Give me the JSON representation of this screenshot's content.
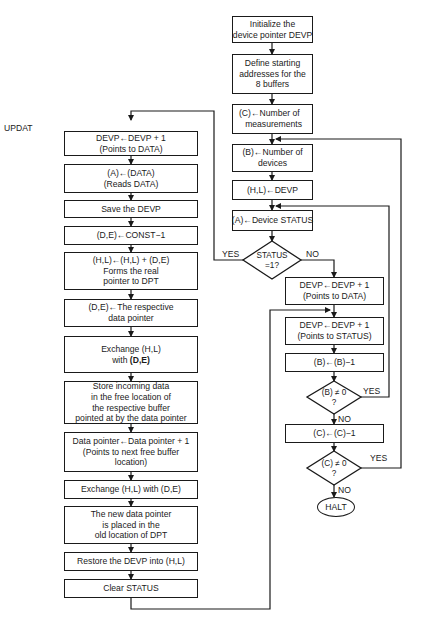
{
  "diagram": {
    "type": "flowchart",
    "entry_label": "UPDAT",
    "main_flow": {
      "init": [
        "Initialize the",
        "device pointer DEVP"
      ],
      "define": [
        "Define starting",
        "addresses for the",
        "8 buffers"
      ],
      "c_num": [
        "(C)←Number of",
        "measurements"
      ],
      "b_num": [
        "(B)←Number of",
        "devices"
      ],
      "hl_devp": "(H,L)←DEVP",
      "a_status": "(A)←Device STATUS",
      "status_decision": [
        "STATUS",
        "=1?"
      ],
      "status_yes": "YES",
      "status_no": "NO",
      "devp_data": [
        "DEVP←DEVP + 1",
        "(Points to DATA)"
      ],
      "devp_status": [
        "DEVP←DEVP + 1",
        "(Points to STATUS)"
      ],
      "b_dec": "(B)←(B)−1",
      "b_decision": [
        "(B) ≠ 0",
        "?"
      ],
      "b_yes": "YES",
      "b_no": "NO",
      "c_dec": "(C)←(C)−1",
      "c_decision": [
        "(C) ≠ 0",
        "?"
      ],
      "c_yes": "YES",
      "c_no": "NO",
      "halt": "HALT"
    },
    "updat_flow": {
      "s1": [
        "DEVP←DEVP + 1",
        "(Points to DATA)"
      ],
      "s2": [
        "(A)←(DATA)",
        "(Reads DATA)"
      ],
      "s3": "Save the DEVP",
      "s4": "(D,E)←CONST−1",
      "s5": [
        "(H,L)←(H,L) + (D,E)",
        "Forms the real",
        "pointer to DPT"
      ],
      "s6": [
        "(D,E)←The respective",
        "data pointer"
      ],
      "s7": [
        "Exchange (H,L)",
        "with",
        "(D,E)"
      ],
      "s8": [
        "Store incoming data",
        "in the free location of",
        "the respective buffer",
        "pointed at by the data pointer"
      ],
      "s9": [
        "Data pointer←Data pointer + 1",
        "(Points to next free buffer",
        "location)"
      ],
      "s10": "Exchange (H,L) with (D,E)",
      "s11": [
        "The new data pointer",
        "is placed in the",
        "old location of DPT"
      ],
      "s12": "Restore the DEVP into (H,L)",
      "s13": "Clear STATUS"
    },
    "colors": {
      "line": "#1a1a1a",
      "background": "#ffffff"
    }
  }
}
